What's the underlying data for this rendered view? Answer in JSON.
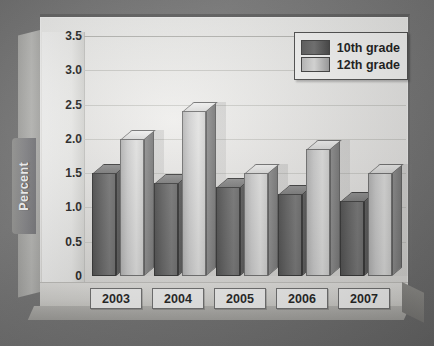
{
  "chart_data": {
    "type": "bar",
    "title": "",
    "xlabel": "",
    "ylabel": "Percent",
    "categories": [
      "2003",
      "2004",
      "2005",
      "2006",
      "2007"
    ],
    "series": [
      {
        "name": "10th grade",
        "values": [
          1.5,
          1.35,
          1.3,
          1.2,
          1.1
        ],
        "color": "#606060"
      },
      {
        "name": "12th grade",
        "values": [
          2.0,
          2.4,
          1.5,
          1.85,
          1.5
        ],
        "color": "#d2d2d1"
      }
    ],
    "ylim": [
      0,
      3.5
    ],
    "yticks": [
      "0",
      "0.5",
      "1.0",
      "1.5",
      "2.0",
      "2.5",
      "3.0",
      "3.5"
    ],
    "ytick_values": [
      0,
      0.5,
      1.0,
      1.5,
      2.0,
      2.5,
      3.0,
      3.5
    ],
    "grid": true,
    "legend_position": "top-right",
    "style": "3d-bar"
  },
  "axis": {
    "y_label": "Percent"
  },
  "legend": {
    "items": [
      {
        "label": "10th grade",
        "swatch": "dark-gray-swatch"
      },
      {
        "label": "12th grade",
        "swatch": "light-gray-swatch"
      }
    ]
  }
}
